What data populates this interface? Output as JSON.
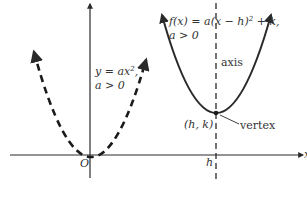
{
  "diagram": {
    "type": "parabola-comparison",
    "colors": {
      "line": "#2a2a2a",
      "text": "#333333",
      "background": "#ffffff"
    },
    "axes": {
      "x_axis_label": "x",
      "origin_label": "O"
    },
    "curves": [
      {
        "name": "standard-parabola",
        "style": "dashed",
        "equation_line1": "y = ax",
        "equation_exp": "2",
        "equation_suffix": ",",
        "condition": "a > 0"
      },
      {
        "name": "shifted-parabola",
        "style": "solid",
        "equation_pre": "f(x) = a(x − h)",
        "equation_exp": "2",
        "equation_post": " + k,",
        "condition": "a > 0"
      }
    ],
    "labels": {
      "axis": "axis",
      "vertex_point": "(h, k)",
      "vertex": "vertex",
      "h_tick": "h"
    }
  }
}
